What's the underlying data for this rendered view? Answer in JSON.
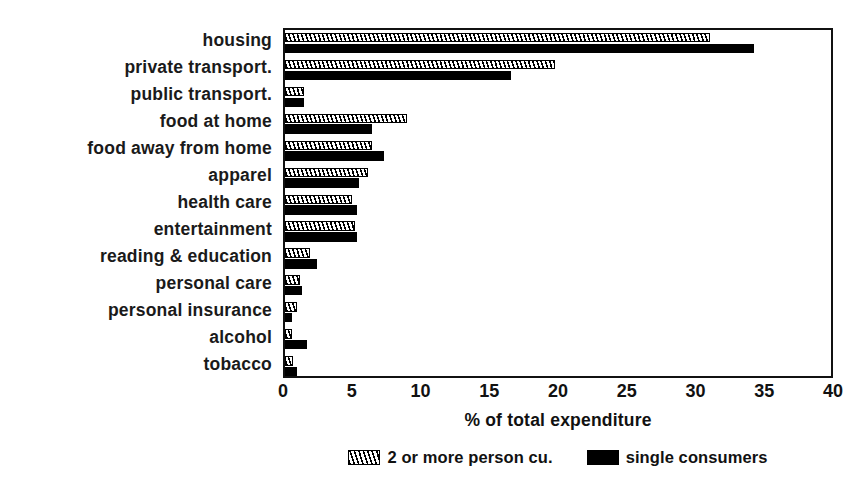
{
  "chart_data": {
    "type": "bar",
    "orientation": "horizontal",
    "title": "",
    "xlabel": "% of total expenditure",
    "ylabel": "",
    "xlim": [
      0,
      40
    ],
    "xticks": [
      0,
      5,
      10,
      15,
      20,
      25,
      30,
      35,
      40
    ],
    "grid": false,
    "legend_position": "bottom-center",
    "categories": [
      "housing",
      "private transport.",
      "public transport.",
      "food at home",
      "food away from home",
      "apparel",
      "health care",
      "entertainment",
      "reading & education",
      "personal care",
      "personal insurance",
      "alcohol",
      "tobacco"
    ],
    "series": [
      {
        "name": "2 or more person cu.",
        "pattern": "hatched",
        "color": "#000000",
        "values": [
          30.9,
          19.6,
          1.4,
          8.9,
          6.3,
          6.0,
          4.9,
          5.1,
          1.8,
          1.1,
          0.9,
          0.5,
          0.6
        ]
      },
      {
        "name": "single consumers",
        "pattern": "solid",
        "color": "#000000",
        "values": [
          34.1,
          16.4,
          1.4,
          6.3,
          7.2,
          5.4,
          5.2,
          5.2,
          2.3,
          1.2,
          0.5,
          1.6,
          0.9
        ]
      }
    ]
  },
  "legend": {
    "items": [
      {
        "label": "2 or more person cu."
      },
      {
        "label": "single consumers"
      }
    ]
  },
  "axis": {
    "x_title": "% of total expenditure",
    "tick_labels": [
      "0",
      "5",
      "10",
      "15",
      "20",
      "25",
      "30",
      "35",
      "40"
    ]
  }
}
